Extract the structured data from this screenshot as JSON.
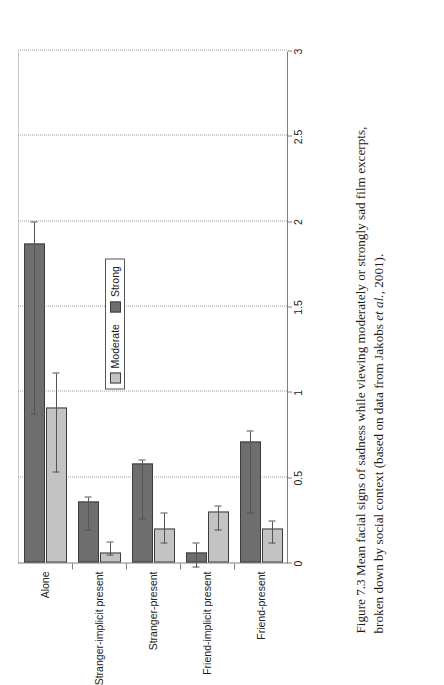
{
  "figure": {
    "caption_prefix": "Figure 7.3",
    "caption_line1": "Mean facial signs of sadness while viewing moderately or strongly sad film excerpts,",
    "caption_line2_a": "broken down by social context (based on data from Jakobs ",
    "caption_line2_italic": "et al.",
    "caption_line2_b": ", 2001)."
  },
  "legend": {
    "position": "inside-lower-left",
    "items": [
      {
        "label": "Moderate",
        "color": "#c3c3c3",
        "swatch_name": "moderate-swatch"
      },
      {
        "label": "Strong",
        "color": "#6e6e6e",
        "swatch_name": "strong-swatch"
      }
    ]
  },
  "chart_data": {
    "type": "bar",
    "orientation": "vertical-bars-rendered-rotated",
    "title": "",
    "xlabel": "",
    "ylabel": "",
    "ylim": [
      0,
      3
    ],
    "yticks": [
      0,
      0.5,
      1,
      1.5,
      2,
      2.5,
      3
    ],
    "ytick_labels": [
      "0",
      "0.5",
      "1",
      "1.5",
      "2",
      "2.5",
      "3"
    ],
    "grid": "dotted gridlines at every 0.5 value step",
    "legend_entries": [
      "Moderate",
      "Strong"
    ],
    "categories": [
      "Alone",
      "Stranger-implicit present",
      "Stranger-present",
      "Friend-implicit present",
      "Friend-present"
    ],
    "series": [
      {
        "name": "Moderate",
        "color": "#c3c3c3",
        "values": [
          0.91,
          0.06,
          0.2,
          0.3,
          0.2
        ],
        "error_low": [
          0.38,
          0.02,
          0.09,
          0.11,
          0.09
        ],
        "error_high": [
          0.2,
          0.06,
          0.09,
          0.03,
          0.04
        ]
      },
      {
        "name": "Strong",
        "color": "#6e6e6e",
        "values": [
          1.87,
          0.36,
          0.58,
          0.06,
          0.71
        ],
        "error_low": [
          1.0,
          0.17,
          0.33,
          0.09,
          0.42
        ],
        "error_high": [
          0.12,
          0.02,
          0.02,
          0.05,
          0.06
        ]
      }
    ]
  }
}
